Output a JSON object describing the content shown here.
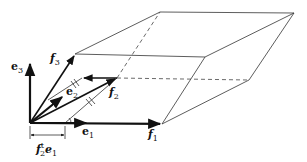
{
  "diagram": {
    "title": "",
    "labels": {
      "e1": {
        "main": "e",
        "sub": "1"
      },
      "e2": {
        "main": "e",
        "sub": "2"
      },
      "e3": {
        "main": "e",
        "sub": "3"
      },
      "f1": {
        "main": "f",
        "sub": "1"
      },
      "f2": {
        "main": "f",
        "sub": "2"
      },
      "f3": {
        "main": "f",
        "sub": "3"
      },
      "projection": {
        "f": "f",
        "f_sub": "2",
        "f_sup": "t",
        "e": "e",
        "e_sub": "1"
      }
    },
    "points": {
      "origin": [
        30,
        123
      ],
      "e1_tip": [
        87,
        123
      ],
      "e2_tip": [
        63,
        96
      ],
      "e3_tip": [
        30,
        62
      ],
      "f1_tip": [
        162,
        124
      ],
      "f2_tip": [
        117,
        78
      ],
      "f3_tip": [
        75,
        54
      ],
      "f1_plus_f3": [
        205,
        57
      ],
      "f1_plus_f2": [
        249,
        80
      ],
      "f2_plus_f3": [
        160,
        12
      ],
      "f1_f2_f3": [
        294,
        13
      ],
      "projection_foot": [
        65,
        123
      ]
    },
    "colors": {
      "ink": "#111111",
      "thin": "#333333",
      "background": "#ffffff"
    }
  }
}
